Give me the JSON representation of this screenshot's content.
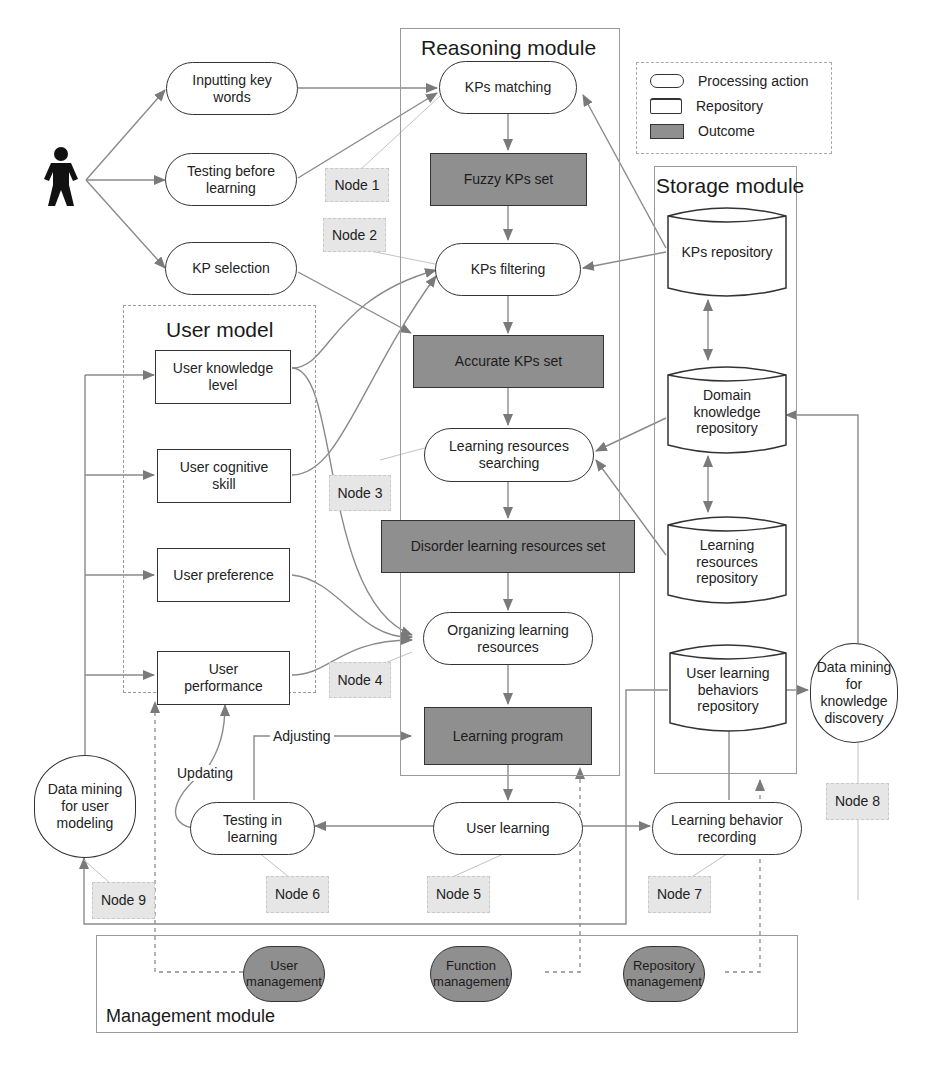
{
  "modules": {
    "reasoning": "Reasoning module",
    "storage": "Storage module",
    "user_model": "User model",
    "management": "Management module"
  },
  "legend": {
    "items": [
      {
        "shape": "rounded-rect",
        "label": "Processing action"
      },
      {
        "shape": "cylinder",
        "label": "Repository"
      },
      {
        "shape": "filled-rect",
        "label": "Outcome"
      }
    ]
  },
  "actor": {
    "icon": "person-icon"
  },
  "user_inputs": [
    {
      "label": "Inputting key words"
    },
    {
      "label": "Testing before learning"
    },
    {
      "label": "KP selection"
    }
  ],
  "reasoning_nodes": {
    "kps_matching": "KPs matching",
    "fuzzy_kps_set": "Fuzzy KPs set",
    "kps_filtering": "KPs filtering",
    "accurate_kps_set": "Accurate KPs set",
    "lr_searching": "Learning resources searching",
    "disorder_set": "Disorder learning resources set",
    "organizing": "Organizing learning resources",
    "learning_program": "Learning program"
  },
  "storage_nodes": {
    "kps_repository": "KPs repository",
    "domain_repository": "Domain knowledge repository",
    "lr_repository": "Learning resources repository",
    "behaviors_repository": "User learning behaviors repository"
  },
  "user_model_items": [
    {
      "label": "User knowledge level"
    },
    {
      "label": "User cognitive skill"
    },
    {
      "label": "User preference"
    },
    {
      "label": "User performance"
    }
  ],
  "process_nodes": {
    "user_learning": "User learning",
    "testing_in_learning": "Testing in learning",
    "behavior_recording": "Learning behavior recording",
    "dm_user_modeling": "Data mining for user modeling",
    "dm_knowledge_discovery": "Data mining for knowledge discovery"
  },
  "edge_labels": {
    "adjusting": "Adjusting",
    "updating": "Updating"
  },
  "node_tags": [
    "Node 1",
    "Node 2",
    "Node 3",
    "Node 4",
    "Node 5",
    "Node 6",
    "Node 7",
    "Node 8",
    "Node 9"
  ],
  "management_items": [
    {
      "label": "User management"
    },
    {
      "label": "Function management"
    },
    {
      "label": "Repository management"
    }
  ]
}
